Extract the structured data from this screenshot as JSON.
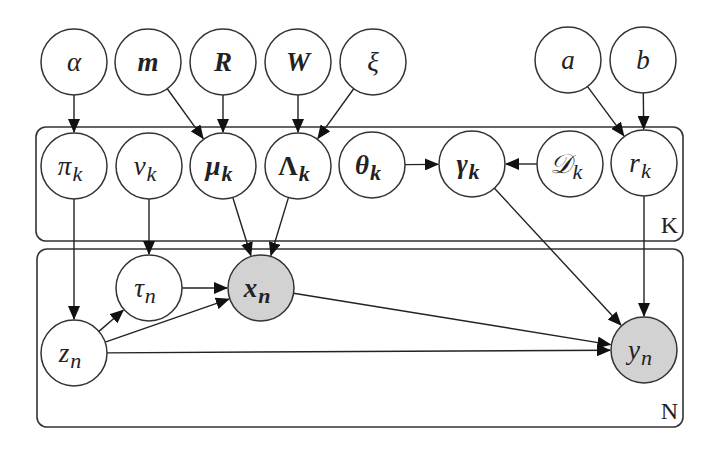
{
  "diagram": {
    "type": "probabilistic-graphical-model",
    "plates": [
      {
        "id": "K",
        "label": "K",
        "x": 36,
        "y": 127,
        "w": 647,
        "h": 114
      },
      {
        "id": "N",
        "label": "N",
        "x": 37,
        "y": 249,
        "w": 646,
        "h": 178
      }
    ],
    "nodes": [
      {
        "id": "alpha",
        "symbol": "α",
        "sub": "",
        "x": 74,
        "y": 62,
        "bold": false,
        "observed": false,
        "plate": ""
      },
      {
        "id": "m",
        "symbol": "m",
        "sub": "",
        "x": 148,
        "y": 62,
        "bold": true,
        "observed": false,
        "plate": ""
      },
      {
        "id": "R",
        "symbol": "R",
        "sub": "",
        "x": 223,
        "y": 62,
        "bold": true,
        "observed": false,
        "plate": ""
      },
      {
        "id": "W",
        "symbol": "W",
        "sub": "",
        "x": 298,
        "y": 62,
        "bold": true,
        "observed": false,
        "plate": ""
      },
      {
        "id": "xi",
        "symbol": "ξ",
        "sub": "",
        "x": 373,
        "y": 62,
        "bold": false,
        "observed": false,
        "plate": ""
      },
      {
        "id": "a",
        "symbol": "a",
        "sub": "",
        "x": 568,
        "y": 60,
        "bold": false,
        "observed": false,
        "plate": ""
      },
      {
        "id": "b",
        "symbol": "b",
        "sub": "",
        "x": 643,
        "y": 60,
        "bold": false,
        "observed": false,
        "plate": ""
      },
      {
        "id": "pi_k",
        "symbol": "π",
        "sub": "k",
        "x": 74,
        "y": 166,
        "bold": false,
        "observed": false,
        "plate": "K"
      },
      {
        "id": "nu_k",
        "symbol": "ν",
        "sub": "k",
        "x": 149,
        "y": 166,
        "bold": false,
        "observed": false,
        "plate": "K"
      },
      {
        "id": "mu_k",
        "symbol": "μ",
        "sub": "k",
        "x": 223,
        "y": 166,
        "bold": true,
        "observed": false,
        "plate": "K"
      },
      {
        "id": "Lambda_k",
        "symbol": "Λ",
        "sub": "k",
        "x": 298,
        "y": 166,
        "bold": true,
        "observed": false,
        "plate": "K",
        "upright": true
      },
      {
        "id": "theta_k",
        "symbol": "θ",
        "sub": "k",
        "x": 372,
        "y": 165,
        "bold": true,
        "observed": false,
        "plate": "K"
      },
      {
        "id": "gamma_k",
        "symbol": "γ",
        "sub": "k",
        "x": 472,
        "y": 164,
        "bold": true,
        "observed": false,
        "plate": "K"
      },
      {
        "id": "D_k",
        "symbol": "𝒟",
        "sub": "k",
        "x": 570,
        "y": 164,
        "bold": false,
        "observed": false,
        "plate": "K"
      },
      {
        "id": "r_k",
        "symbol": "r",
        "sub": "k",
        "x": 644,
        "y": 163,
        "bold": false,
        "observed": false,
        "plate": "K"
      },
      {
        "id": "tau_n",
        "symbol": "τ",
        "sub": "n",
        "x": 149,
        "y": 288,
        "bold": false,
        "observed": false,
        "plate": "N"
      },
      {
        "id": "x_n",
        "symbol": "x",
        "sub": "n",
        "x": 261,
        "y": 288,
        "bold": true,
        "observed": true,
        "plate": "N"
      },
      {
        "id": "z_n",
        "symbol": "z",
        "sub": "n",
        "x": 74,
        "y": 353,
        "bold": false,
        "observed": false,
        "plate": "N"
      },
      {
        "id": "y_n",
        "symbol": "y",
        "sub": "n",
        "x": 644,
        "y": 350,
        "bold": false,
        "observed": true,
        "plate": "N"
      }
    ],
    "edges": [
      {
        "from": "alpha",
        "to": "pi_k"
      },
      {
        "from": "m",
        "to": "mu_k"
      },
      {
        "from": "R",
        "to": "mu_k"
      },
      {
        "from": "W",
        "to": "Lambda_k"
      },
      {
        "from": "xi",
        "to": "Lambda_k"
      },
      {
        "from": "a",
        "to": "r_k"
      },
      {
        "from": "b",
        "to": "r_k"
      },
      {
        "from": "theta_k",
        "to": "gamma_k"
      },
      {
        "from": "D_k",
        "to": "gamma_k"
      },
      {
        "from": "pi_k",
        "to": "z_n"
      },
      {
        "from": "nu_k",
        "to": "tau_n"
      },
      {
        "from": "mu_k",
        "to": "x_n"
      },
      {
        "from": "Lambda_k",
        "to": "x_n"
      },
      {
        "from": "gamma_k",
        "to": "y_n"
      },
      {
        "from": "r_k",
        "to": "y_n"
      },
      {
        "from": "z_n",
        "to": "tau_n"
      },
      {
        "from": "tau_n",
        "to": "x_n"
      },
      {
        "from": "z_n",
        "to": "x_n"
      },
      {
        "from": "x_n",
        "to": "y_n"
      },
      {
        "from": "z_n",
        "to": "y_n"
      }
    ],
    "node_radius": 33,
    "colors": {
      "stroke": "#333333",
      "observed_fill": "#d2d2d2",
      "latent_fill": "#ffffff",
      "background": "#ffffff"
    }
  }
}
